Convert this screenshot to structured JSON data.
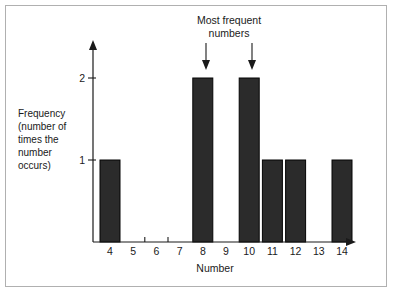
{
  "chart_data": {
    "type": "bar",
    "title": "",
    "subtitle": "",
    "xlabel": "Number",
    "ylabel": "Frequency (number of times the number occurs)",
    "categories": [
      "4",
      "5",
      "6",
      "7",
      "8",
      "9",
      "10",
      "11",
      "12",
      "13",
      "14"
    ],
    "values": [
      1,
      0,
      0,
      0,
      2,
      0,
      2,
      1,
      1,
      0,
      1
    ],
    "xlim": [
      3.5,
      14.9
    ],
    "ylim": [
      0,
      2.35
    ],
    "yticks": [
      "1",
      "2"
    ],
    "ytick_values": [
      1,
      2
    ],
    "grid": false,
    "legend": null,
    "annotations": [
      {
        "text": "Most frequent numbers",
        "text_line_1": "Most frequent",
        "text_line_2": "numbers",
        "points_to": [
          "8",
          "10"
        ],
        "arrow": "down"
      }
    ],
    "bar_color": "#2b2b2b",
    "axis_color": "#1a1a1a",
    "background": "#ffffff",
    "frame_color": "#b0b0b0"
  },
  "ylabel_lines": [
    "Frequency",
    "(number of",
    "times the",
    "number",
    "occurs)"
  ],
  "axis_titles": {
    "x": "Number",
    "y": "Frequency (number of times the number occurs)"
  }
}
